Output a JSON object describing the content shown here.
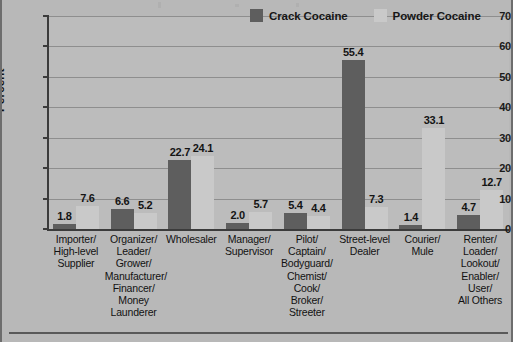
{
  "chart_data": {
    "type": "bar",
    "title": "",
    "xlabel": "",
    "ylabel": "Percent",
    "ylim": [
      0,
      70
    ],
    "yticks": [
      0,
      10,
      20,
      30,
      40,
      50,
      60,
      70
    ],
    "grid": true,
    "legend_position": "top-right",
    "categories": [
      "Importer/\nHigh-level\nSupplier",
      "Organizer/\nLeader/\nGrower/\nManufacturer/\nFinancer/\nMoney\nLaunderer",
      "Wholesaler",
      "Manager/\nSupervisor",
      "Pilot/\nCaptain/\nBodyguard/\nChemist/\nCook/\nBroker/\nStreeter",
      "Street-level\nDealer",
      "Courier/\nMule",
      "Renter/\nLoader/\nLookout/\nEnabler/\nUser/\nAll Others"
    ],
    "series": [
      {
        "name": "Crack Cocaine",
        "color": "#5e5e5e",
        "values": [
          1.8,
          6.6,
          22.7,
          2.0,
          5.4,
          55.4,
          1.4,
          4.7
        ]
      },
      {
        "name": "Powder Cocaine",
        "color": "#c9c9c9",
        "values": [
          7.6,
          5.2,
          24.1,
          5.7,
          4.4,
          7.3,
          33.1,
          12.7
        ]
      }
    ]
  },
  "axis": {
    "ylabel": "Percent",
    "tick_labels": [
      "70",
      "60",
      "50",
      "40",
      "30",
      "20",
      "10",
      "0"
    ]
  },
  "legend": {
    "items": [
      {
        "label": "Crack Cocaine",
        "color": "#5e5e5e"
      },
      {
        "label": "Powder Cocaine",
        "color": "#c9c9c9"
      }
    ]
  },
  "categories": [
    {
      "lines": [
        "Importer/",
        "High-level",
        "Supplier"
      ]
    },
    {
      "lines": [
        "Organizer/",
        "Leader/",
        "Grower/",
        "Manufacturer/",
        "Financer/",
        "Money",
        "Launderer"
      ]
    },
    {
      "lines": [
        "Wholesaler"
      ]
    },
    {
      "lines": [
        "Manager/",
        "Supervisor"
      ]
    },
    {
      "lines": [
        "Pilot/",
        "Captain/",
        "Bodyguard/",
        "Chemist/",
        "Cook/",
        "Broker/",
        "Streeter"
      ]
    },
    {
      "lines": [
        "Street-level",
        "Dealer"
      ]
    },
    {
      "lines": [
        "Courier/",
        "Mule"
      ]
    },
    {
      "lines": [
        "Renter/",
        "Loader/",
        "Lookout/",
        "Enabler/",
        "User/",
        "All Others"
      ]
    }
  ],
  "colors": {
    "crack": "#5e5e5e",
    "powder": "#c9c9c9",
    "background": "#b8b8b8",
    "plot_background": "#bcbcbc",
    "gridline": "#8e8e8e",
    "axis": "#3b3b3b",
    "text": "#141414"
  }
}
